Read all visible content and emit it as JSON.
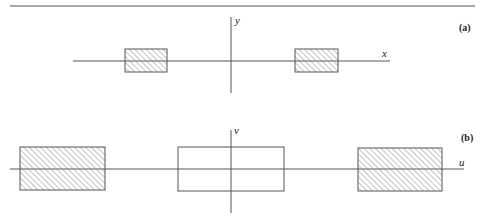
{
  "figure": {
    "panel_a": {
      "label": "(a)",
      "x_axis_label": "x",
      "y_axis_label": "y",
      "shapes": [
        {
          "type": "hatched-rect",
          "position": "left"
        },
        {
          "type": "hatched-rect",
          "position": "right"
        }
      ]
    },
    "panel_b": {
      "label": "(b)",
      "x_axis_label": "u",
      "y_axis_label": "v",
      "shapes": [
        {
          "type": "hatched-rect",
          "position": "left"
        },
        {
          "type": "plain-rect",
          "position": "center"
        },
        {
          "type": "hatched-rect",
          "position": "right"
        }
      ]
    },
    "colors": {
      "line": "#555555",
      "hatch": "#777777",
      "background": "#ffffff"
    }
  }
}
